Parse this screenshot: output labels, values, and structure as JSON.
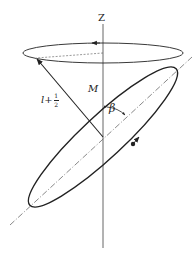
{
  "figure": {
    "caption_partial": "",
    "labels": {
      "z_axis": "Z",
      "projection": "M",
      "angle": "β",
      "vector_base": "l+",
      "vector_frac_num": "1",
      "vector_frac_den": "2"
    },
    "elements": {
      "z_axis": {
        "x": 103,
        "y1": 24,
        "y2": 248
      },
      "precession_ellipse": {
        "cx": 103,
        "cy": 53,
        "rx": 80,
        "ry": 10,
        "direction_arrow": "left"
      },
      "tilted_ellipse": {
        "cx": 103,
        "cy": 137,
        "rx": 100,
        "ry": 20,
        "rotation_deg": -43,
        "direction_arrow": "up-right"
      },
      "tilted_axis": {
        "x1": 10,
        "y1": 225,
        "x2": 192,
        "y2": 57,
        "style": "dash-dot"
      },
      "vector": {
        "x1": 103,
        "y1": 137,
        "x2": 36,
        "y2": 58,
        "label": "l+1/2"
      },
      "radius_dashed": {
        "x1": 103,
        "y1": 53,
        "x2": 36,
        "y2": 58
      }
    },
    "colors": {
      "line": "#222222",
      "axis": "#666666",
      "background": "#ffffff"
    }
  }
}
